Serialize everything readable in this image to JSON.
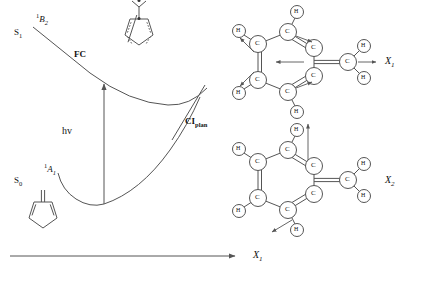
{
  "figure": {
    "line_color": "#555555",
    "text_color": "#1a1a1a"
  },
  "energy_diagram": {
    "states": [
      {
        "id": "s1",
        "label": "S",
        "sub": "1",
        "x": 14,
        "y": 33
      },
      {
        "id": "s0",
        "label": "S",
        "sub": "0",
        "x": 14,
        "y": 181
      }
    ],
    "term_symbols": [
      {
        "id": "b2",
        "pre": "1",
        "letter": "B",
        "sub": "2",
        "x": 36,
        "y": 18
      },
      {
        "id": "a1",
        "pre": "1",
        "letter": "A",
        "sub": "1",
        "x": 44,
        "y": 168
      }
    ],
    "points": [
      {
        "id": "fc",
        "label": "FC",
        "sub": "",
        "x": 74,
        "y": 55
      },
      {
        "id": "ci",
        "label": "CI",
        "sub": "plan",
        "x": 185,
        "y": 122
      }
    ],
    "excitation": {
      "label": "hv",
      "x": 62,
      "y": 131
    },
    "axis": {
      "label": "X",
      "sub": "1",
      "x": 253,
      "y": 256
    }
  },
  "normal_modes": [
    {
      "id": "x1",
      "label": "X",
      "sub": "1",
      "x": 385,
      "y": 62
    },
    {
      "id": "x2",
      "label": "X",
      "sub": "2",
      "x": 385,
      "y": 181
    }
  ],
  "molecules": {
    "excited_fulvene": {
      "name": "excited-state fulvene biradical",
      "radical_dots": 2
    },
    "ground_fulvene": {
      "name": "ground-state fulvene"
    },
    "mode_x1": {
      "name": "fulvene normal mode X1",
      "atoms": [
        "C",
        "C",
        "C",
        "C",
        "C",
        "C",
        "H",
        "H",
        "H",
        "H",
        "H",
        "H"
      ]
    },
    "mode_x2": {
      "name": "fulvene normal mode X2",
      "atoms": [
        "C",
        "C",
        "C",
        "C",
        "C",
        "C",
        "H",
        "H",
        "H",
        "H",
        "H",
        "H"
      ]
    }
  },
  "atom_labels": {
    "carbon": "C",
    "hydrogen": "H"
  }
}
